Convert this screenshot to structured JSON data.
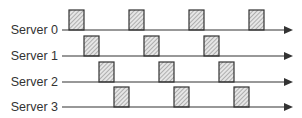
{
  "diagram": {
    "axis_color": "#333333",
    "box_fill_color": "#d9d9d9",
    "box_stroke_color": "#333333",
    "timeline_start_x": 62,
    "timeline_end_x": 293,
    "box_width": 15,
    "box_height": 20,
    "servers": [
      {
        "label": "Server 0",
        "y": 30,
        "boxes": [
          69,
          129,
          189,
          249
        ]
      },
      {
        "label": "Server 1",
        "y": 56,
        "boxes": [
          84,
          144,
          204
        ]
      },
      {
        "label": "Server 2",
        "y": 82,
        "boxes": [
          99,
          159,
          219
        ]
      },
      {
        "label": "Server 3",
        "y": 107,
        "boxes": [
          114,
          174,
          234
        ]
      }
    ]
  }
}
